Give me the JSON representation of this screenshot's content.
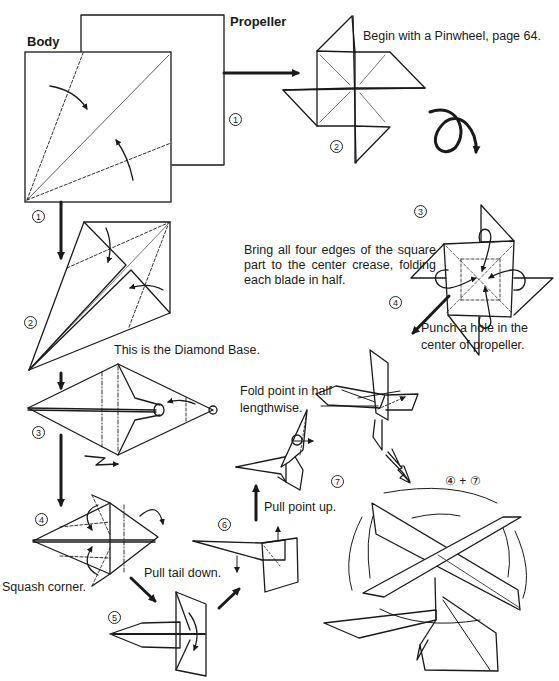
{
  "labels": {
    "body": "Body",
    "propeller": "Propeller",
    "begin_pinwheel": "Begin with a Pinwheel, page 64.",
    "bring_edges": "Bring all four edges of the square part to the center crease, folding each blade in half.",
    "punch_hole_line1": "Punch a hole in the",
    "punch_hole_line2": "center of propeller.",
    "diamond_base": "This is the Diamond Base.",
    "fold_point_line1": "Fold point in half",
    "fold_point_line2": "lengthwise.",
    "pull_point_up": "Pull point up.",
    "pull_tail_down": "Pull tail down.",
    "squash_corner": "Squash corner.",
    "combine": "④ + ⑦"
  },
  "steps": {
    "body_1": "1",
    "prop_1": "1",
    "body_2": "2",
    "body_3": "3",
    "body_4": "4",
    "body_5": "5",
    "body_6": "6",
    "body_7": "7",
    "prop_2": "2",
    "prop_3": "3",
    "prop_4": "4"
  },
  "colors": {
    "ink": "#1a1a1a",
    "paper": "#ffffff"
  }
}
